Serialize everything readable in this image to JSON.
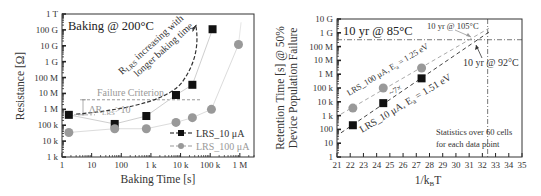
{
  "chart_data": [
    {
      "type": "scatter",
      "title": "Baking @ 200°C",
      "xlabel": "Baking Time [s]",
      "ylabel": "Resistance [Ω]",
      "xscale": "log",
      "yscale": "log",
      "xlim": [
        1,
        3000000
      ],
      "ylim": [
        1000,
        1000000000000
      ],
      "grid": false,
      "legend_position": "lower right",
      "x_ticks": [
        1,
        10,
        100,
        1000,
        10000,
        100000,
        1000000
      ],
      "x_tick_labels": [
        "1",
        "10",
        "100",
        "1 k",
        "10 k",
        "100 k",
        "1 M"
      ],
      "y_ticks": [
        1000,
        10000,
        100000,
        1000000,
        10000000,
        100000000,
        1000000000,
        10000000000,
        100000000000,
        1000000000000
      ],
      "y_tick_labels": [
        "1 k",
        "10 k",
        "100 k",
        "1 M",
        "10 M",
        "100 M",
        "1 G",
        "10 G",
        "100 G",
        "1 T"
      ],
      "series": [
        {
          "name": "LRS_10 μA",
          "marker": "square",
          "color": "#111111",
          "x": [
            1.7,
            60,
            700,
            7000,
            25000,
            120000
          ],
          "y": [
            450000,
            120000,
            380000,
            8000000,
            35000000,
            110000000000
          ]
        },
        {
          "name": "LRS_100 μA",
          "marker": "circle",
          "color": "#999999",
          "x": [
            1.7,
            60,
            700,
            7000,
            25000,
            110000,
            900000
          ],
          "y": [
            35000,
            60000,
            60000,
            150000,
            300000,
            1000000,
            12000000000
          ]
        }
      ],
      "annotations": [
        {
          "text": "Failure Criterion",
          "type": "hline",
          "y": 4000000,
          "color": "#999999"
        },
        {
          "text": "ΔR_LRS>10",
          "type": "bracket"
        },
        {
          "text": "R_LRS increasing with longer baking time",
          "type": "trend-arrow"
        }
      ]
    },
    {
      "type": "scatter",
      "title": "10 yr @ 85°C",
      "xlabel": "1/k_B T",
      "ylabel": "Retention Time [s] @ 50% Device Population Failure",
      "xscale": "linear",
      "yscale": "log",
      "xlim": [
        21,
        35
      ],
      "ylim": [
        1,
        10000000000
      ],
      "grid": false,
      "x_ticks": [
        21,
        22,
        23,
        24,
        25,
        26,
        27,
        28,
        29,
        30,
        31,
        32,
        33,
        34,
        35
      ],
      "y_ticks": [
        1,
        10,
        100,
        1000,
        10000,
        100000,
        1000000,
        10000000,
        100000000,
        1000000000,
        10000000000
      ],
      "y_tick_labels": [
        "1",
        "10",
        "100",
        "1 k",
        "10 k",
        "100 k",
        "1 M",
        "10 M",
        "100 M",
        "1 G",
        "10 G"
      ],
      "series": [
        {
          "name": "LRS_100 μA, E_a = 1.25 eV",
          "marker": "circle",
          "color": "#999999",
          "x": [
            22.2,
            24.5,
            27.4
          ],
          "y": [
            3500,
            100000,
            2800000
          ],
          "fit": {
            "x": [
              21.3,
              32.5
            ],
            "ea_eV": 1.25
          }
        },
        {
          "name": "LRS_10 μA, E_a = 1.51 eV",
          "marker": "square",
          "color": "#111111",
          "x": [
            22.2,
            24.5,
            27.4
          ],
          "y": [
            200,
            8000,
            500000
          ],
          "fit": {
            "x": [
              21.3,
              32.5
            ],
            "ea_eV": 1.51
          }
        }
      ],
      "reference_lines": [
        {
          "type": "hline",
          "y": 315000000,
          "label": "10 yr"
        },
        {
          "type": "vline",
          "x": 32.4,
          "label": "85°C"
        }
      ],
      "annotations": [
        {
          "text": "10 yr @ 105°C",
          "color": "#999999"
        },
        {
          "text": "10 yr @ 92°C",
          "color": "#111111"
        },
        {
          "text": "Statistics over 60 cells for each data point"
        }
      ]
    }
  ],
  "left": {
    "title": "Baking @ 200°C",
    "ylabel": "Resistance [Ω]",
    "xlabel": "Baking Time [s]",
    "y_tick_labels": [
      "1 k",
      "10 k",
      "100 k",
      "1 M",
      "10 M",
      "100 M",
      "1 G",
      "10 G",
      "100 G",
      "1 T"
    ],
    "x_tick_labels": [
      "1",
      "10",
      "100",
      "1 k",
      "10 k",
      "100 k",
      "1 M"
    ],
    "failure_label": "Failure Criterion",
    "delta_label_main": "ΔR",
    "delta_label_sub": "LRS",
    "delta_label_tail": ">10",
    "trend_label_r": "R",
    "trend_label_sub": "LRS",
    "trend_label_line1": " increasing with",
    "trend_label_line2": "longer baking time",
    "legend": [
      {
        "label": "LRS_10 μA"
      },
      {
        "label": "LRS_100 μA"
      }
    ]
  },
  "right": {
    "title": "10 yr @ 85°C",
    "ylabel_line1": "Retention Time [s] @ 50%",
    "ylabel_line2": "Device Population Failure",
    "xlabel_main": "1/k",
    "xlabel_sub": "B",
    "xlabel_tail": "T",
    "y_tick_labels": [
      "1",
      "10",
      "100",
      "1 k",
      "10 k",
      "100 k",
      "1 M",
      "10 M",
      "100 M",
      "1 G",
      "10 G"
    ],
    "x_tick_labels": [
      "21",
      "22",
      "23",
      "24",
      "25",
      "26",
      "27",
      "28",
      "29",
      "30",
      "31",
      "32",
      "33",
      "34",
      "35"
    ],
    "fit_100_label": "LRS_100 μA, E",
    "fit_100_sub": "a",
    "fit_100_tail": " = 1.25 eV",
    "fit_10_label": "LRS_10 μA, E",
    "fit_10_sub": "a",
    "fit_10_tail": " = 1.51 eV",
    "delta_label": "~7×",
    "label_105": "10 yr @ 105°C",
    "label_92": "10 yr @ 92°C",
    "stats_line1": "Statistics over 60 cells",
    "stats_line2": "for each data point"
  }
}
